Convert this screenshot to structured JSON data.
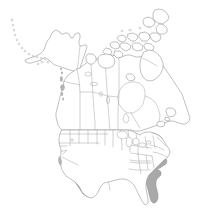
{
  "figure": {
    "kind": "distribution-range-map",
    "region": "North America",
    "projection_note": "Lambert conformal conic, North America extent",
    "background_color": "#ffffff",
    "width_px": 209,
    "height_px": 212
  },
  "legend": {
    "present_label": "Present",
    "absent_label": "Absent",
    "present_color": "#a9a9a9",
    "absent_color": "#ffffff",
    "border_color": "#8d8d8d"
  },
  "map_data": {
    "countries": [
      {
        "name": "Canada",
        "shaded": false
      },
      {
        "name": "United States",
        "shaded": "partial"
      },
      {
        "name": "Mexico",
        "shaded": "partial",
        "note": "only northern border edge visible"
      }
    ],
    "shaded_regions": [
      "Arizona",
      "New Mexico",
      "Colorado",
      "Utah (southern)",
      "Nebraska",
      "Kansas",
      "Oklahoma",
      "Texas",
      "Missouri",
      "Arkansas",
      "Louisiana",
      "Mississippi (western)",
      "Florida",
      "Georgia (coastal)",
      "South Carolina (coastal)"
    ],
    "unshaded_regions": [
      "Alaska",
      "Washington",
      "Oregon",
      "California",
      "Nevada",
      "Idaho",
      "Montana",
      "Wyoming",
      "North Dakota",
      "South Dakota",
      "Minnesota",
      "Iowa",
      "Wisconsin",
      "Illinois",
      "Michigan",
      "Indiana",
      "Ohio",
      "Kentucky",
      "Tennessee",
      "Alabama",
      "North Carolina",
      "Virginia",
      "West Virginia",
      "Pennsylvania",
      "New York",
      "New England",
      "British Columbia",
      "Alberta",
      "Saskatchewan",
      "Manitoba",
      "Ontario",
      "Quebec",
      "Newfoundland and Labrador",
      "Yukon",
      "Northwest Territories",
      "Nunavut"
    ],
    "water_features": [
      "Hudson Bay",
      "Great Lakes",
      "Great Salt Lake",
      "Lake Winnipeg",
      "Great Bear Lake",
      "Great Slave Lake",
      "Gulf of Mexico",
      "Atlantic Ocean",
      "Pacific Ocean",
      "Arctic Ocean"
    ],
    "island_groups": [
      "Aleutian Islands",
      "Canadian Arctic Archipelago",
      "Baffin Island",
      "Victoria Island",
      "Banks Island",
      "Ellesmere Island",
      "Newfoundland",
      "Vancouver Island",
      "Haida Gwaii"
    ]
  }
}
